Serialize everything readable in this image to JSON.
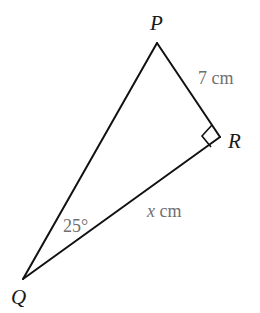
{
  "diagram": {
    "type": "right-triangle",
    "vertices": {
      "P": {
        "label": "P",
        "x": 157,
        "y": 43
      },
      "Q": {
        "label": "Q",
        "x": 23,
        "y": 279
      },
      "R": {
        "label": "R",
        "x": 220,
        "y": 137
      }
    },
    "sides": {
      "PR": {
        "label_value": "7",
        "label_unit": " cm"
      },
      "QR": {
        "label_value": "x",
        "label_unit": " cm"
      }
    },
    "angles": {
      "Q": {
        "label": "25°"
      },
      "R": {
        "right_angle": true
      }
    },
    "colors": {
      "line": "#111111",
      "vertex_label": "#1a1a1a",
      "measure_label": "#707070"
    }
  }
}
